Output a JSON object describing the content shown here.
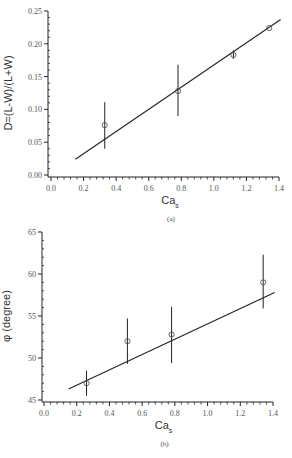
{
  "chart_data": [
    {
      "id": "a",
      "type": "scatter",
      "caption": "(a)",
      "title": "",
      "xlabel": "Ca",
      "xlabel_sub": "s",
      "ylabel": "D=(L-W)/(L+W)",
      "xlim": [
        0.0,
        1.4
      ],
      "ylim": [
        0.0,
        0.25
      ],
      "xticks": [
        "0.0",
        "0.2",
        "0.4",
        "0.6",
        "0.8",
        "1.0",
        "1.2",
        "1.4"
      ],
      "yticks": [
        "0.00",
        "0.05",
        "0.10",
        "0.15",
        "0.20",
        "0.25"
      ],
      "grid": false,
      "series": [
        {
          "name": "measured",
          "marker": "open-circle",
          "x": [
            0.33,
            0.78,
            1.12,
            1.34
          ],
          "y": [
            0.076,
            0.128,
            0.183,
            0.224
          ],
          "err_low": [
            0.04,
            0.09,
            0.177,
            0.224
          ],
          "err_high": [
            0.111,
            0.168,
            0.19,
            0.224
          ]
        },
        {
          "name": "linear fit",
          "type": "line",
          "x": [
            0.15,
            1.41
          ],
          "y": [
            0.024,
            0.237
          ]
        }
      ]
    },
    {
      "id": "b",
      "type": "scatter",
      "caption": "(b)",
      "title": "",
      "xlabel": "Ca",
      "xlabel_sub": "s",
      "ylabel": "φ (degree)",
      "xlim": [
        0.0,
        1.4
      ],
      "ylim": [
        45,
        65
      ],
      "xticks": [
        "0.0",
        "0.2",
        "0.4",
        "0.6",
        "0.8",
        "1.0",
        "1.2",
        "1.4"
      ],
      "yticks": [
        "45",
        "50",
        "55",
        "60",
        "65"
      ],
      "grid": false,
      "series": [
        {
          "name": "measured",
          "marker": "open-circle",
          "x": [
            0.26,
            0.51,
            0.78,
            1.34
          ],
          "y": [
            47.0,
            52.0,
            52.8,
            59.0
          ],
          "err_low": [
            45.5,
            49.3,
            49.4,
            55.9
          ],
          "err_high": [
            48.5,
            54.7,
            56.1,
            62.3
          ]
        },
        {
          "name": "linear fit",
          "type": "line",
          "x": [
            0.15,
            1.41
          ],
          "y": [
            46.3,
            57.8
          ]
        }
      ]
    }
  ],
  "layout": {
    "a": {
      "x0": 51,
      "x1": 279,
      "y0": 175,
      "y1": 11,
      "axisX": 48,
      "axisY": 177
    },
    "b": {
      "x0": 44,
      "x1": 273,
      "y0": 400,
      "y1": 232,
      "axisX": 42,
      "axisY": 402
    }
  },
  "colors": {
    "ink": "#222222",
    "marker": "#555555",
    "text": "#444444"
  }
}
